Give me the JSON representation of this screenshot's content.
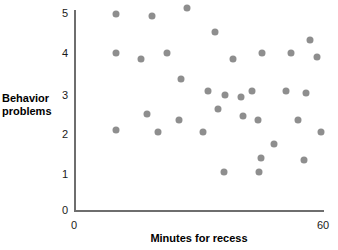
{
  "chart_data": {
    "type": "scatter",
    "title": "",
    "xlabel": "Minutes for recess",
    "ylabel": "Behavior problems",
    "xlim": [
      0,
      60
    ],
    "ylim": [
      0,
      5
    ],
    "grid": false,
    "legend": null,
    "marker_color": "#8e8e8e",
    "axis_color": "#6e6e6e",
    "xticks": [
      {
        "value": 0,
        "label": "0",
        "px": 74
      },
      {
        "value": 60,
        "label": "60",
        "px": 323
      }
    ],
    "yticks": [
      {
        "value": 0,
        "label": "0",
        "px": 211
      },
      {
        "value": 1,
        "label": "1",
        "px": 175
      },
      {
        "value": 2,
        "label": "2",
        "px": 135
      },
      {
        "value": 3,
        "label": "3",
        "px": 96
      },
      {
        "value": 4,
        "label": "4",
        "px": 54
      },
      {
        "value": 5,
        "label": "5",
        "px": 14
      }
    ],
    "points": [
      {
        "x": 10.0,
        "y": 5.0
      },
      {
        "x": 18.8,
        "y": 4.95
      },
      {
        "x": 27.2,
        "y": 5.15
      },
      {
        "x": 34.0,
        "y": 4.55
      },
      {
        "x": 10.0,
        "y": 4.0
      },
      {
        "x": 16.1,
        "y": 3.85
      },
      {
        "x": 22.4,
        "y": 4.0
      },
      {
        "x": 45.3,
        "y": 4.0
      },
      {
        "x": 52.3,
        "y": 4.0
      },
      {
        "x": 56.9,
        "y": 4.35
      },
      {
        "x": 58.6,
        "y": 3.9
      },
      {
        "x": 38.3,
        "y": 3.85
      },
      {
        "x": 25.8,
        "y": 3.35
      },
      {
        "x": 32.2,
        "y": 3.05
      },
      {
        "x": 43.0,
        "y": 3.05
      },
      {
        "x": 51.1,
        "y": 3.05
      },
      {
        "x": 55.9,
        "y": 3.0
      },
      {
        "x": 36.4,
        "y": 2.95
      },
      {
        "x": 40.2,
        "y": 2.9
      },
      {
        "x": 34.7,
        "y": 2.6
      },
      {
        "x": 17.6,
        "y": 2.45
      },
      {
        "x": 40.7,
        "y": 2.4
      },
      {
        "x": 25.3,
        "y": 2.3
      },
      {
        "x": 44.3,
        "y": 2.3
      },
      {
        "x": 54.0,
        "y": 2.3
      },
      {
        "x": 10.1,
        "y": 2.05
      },
      {
        "x": 20.3,
        "y": 2.0
      },
      {
        "x": 31.2,
        "y": 2.0
      },
      {
        "x": 59.5,
        "y": 2.0
      },
      {
        "x": 48.1,
        "y": 1.7
      },
      {
        "x": 45.1,
        "y": 1.35
      },
      {
        "x": 55.4,
        "y": 1.3
      },
      {
        "x": 36.2,
        "y": 1.0
      },
      {
        "x": 44.6,
        "y": 1.0
      }
    ]
  },
  "labels": {
    "y_axis_title": "Behavior problems",
    "x_axis_title": "Minutes for recess"
  }
}
